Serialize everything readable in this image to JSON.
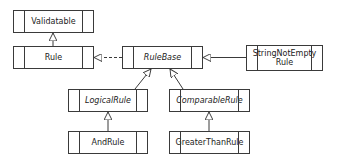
{
  "diagram": {
    "type": "uml-class-diagram",
    "classes": [
      {
        "id": "validatable",
        "label": "Validatable",
        "abstract": false
      },
      {
        "id": "rule",
        "label": "Rule",
        "abstract": false
      },
      {
        "id": "rulebase",
        "label": "RuleBase",
        "abstract": true
      },
      {
        "id": "stringnotemptyrule",
        "label": "StringNotEmpty\nRule",
        "abstract": false
      },
      {
        "id": "logicalrule",
        "label": "LogicalRule",
        "abstract": true
      },
      {
        "id": "comparablerule",
        "label": "ComparableRule",
        "abstract": true
      },
      {
        "id": "andrule",
        "label": "AndRule",
        "abstract": false
      },
      {
        "id": "greaterthanrule",
        "label": "GreaterThanRule",
        "abstract": false
      }
    ],
    "relations": [
      {
        "from": "rule",
        "to": "validatable",
        "kind": "inheritance"
      },
      {
        "from": "rulebase",
        "to": "rule",
        "kind": "realization"
      },
      {
        "from": "stringnotemptyrule",
        "to": "rulebase",
        "kind": "inheritance"
      },
      {
        "from": "logicalrule",
        "to": "rulebase",
        "kind": "inheritance"
      },
      {
        "from": "comparablerule",
        "to": "rulebase",
        "kind": "inheritance"
      },
      {
        "from": "andrule",
        "to": "logicalrule",
        "kind": "inheritance"
      },
      {
        "from": "greaterthanrule",
        "to": "comparablerule",
        "kind": "inheritance"
      }
    ],
    "colors": {
      "line": "#3a3a3a",
      "background": "#ffffff",
      "text": "#222222"
    }
  }
}
